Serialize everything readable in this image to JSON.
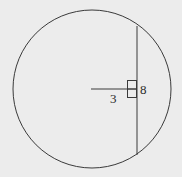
{
  "diagram": {
    "type": "circle-chord-geometry",
    "circle": {
      "cx": 92,
      "cy": 89,
      "r": 79
    },
    "chord": {
      "x": 137,
      "y1": 26,
      "y2": 155
    },
    "radius_segment": {
      "x1": 91,
      "x2": 137,
      "y": 89
    },
    "right_angle_marker": true,
    "labels": {
      "distance": "3",
      "half_chord": "8"
    },
    "colors": {
      "background": "#ececec",
      "stroke": "#3a3a3a"
    }
  }
}
